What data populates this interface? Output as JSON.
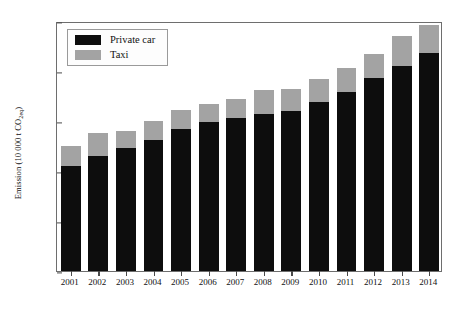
{
  "chart_data": {
    "type": "bar",
    "subtype": "stacked-bar",
    "title": "",
    "xlabel": "",
    "ylabel": "Emission (10 000 t CO2eq)",
    "ylabel_parts": {
      "prefix": "Emission (10 000 t CO",
      "sub": "2eq",
      "suffix": ")"
    },
    "categories": [
      "2001",
      "2002",
      "2003",
      "2004",
      "2005",
      "2006",
      "2007",
      "2008",
      "2009",
      "2010",
      "2011",
      "2012",
      "2013",
      "2014"
    ],
    "series": [
      {
        "name": "Private car",
        "color": "#0d0d0d",
        "values": [
          10.5,
          11.5,
          12.3,
          13.1,
          14.2,
          14.9,
          15.3,
          15.7,
          16.0,
          16.9,
          17.9,
          19.3,
          20.5,
          21.8
        ]
      },
      {
        "name": "Taxi",
        "color": "#a3a3a3",
        "values": [
          2.0,
          2.3,
          1.7,
          1.9,
          1.9,
          1.8,
          1.9,
          2.4,
          2.2,
          2.3,
          2.4,
          2.4,
          3.0,
          2.8
        ]
      }
    ],
    "totals": [
      12.5,
      13.8,
      14.0,
      15.0,
      16.1,
      16.7,
      17.2,
      18.1,
      18.2,
      19.2,
      20.3,
      21.7,
      23.5,
      24.6
    ],
    "ylim": [
      0,
      25
    ],
    "yticks": [
      0,
      5,
      10,
      15,
      20,
      25
    ],
    "ytick_labels": [
      "0",
      "5",
      "10",
      "15",
      "20",
      "25"
    ],
    "grid": false,
    "legend_position": "top-left",
    "legend_entries": [
      "Private car",
      "Taxi"
    ]
  }
}
